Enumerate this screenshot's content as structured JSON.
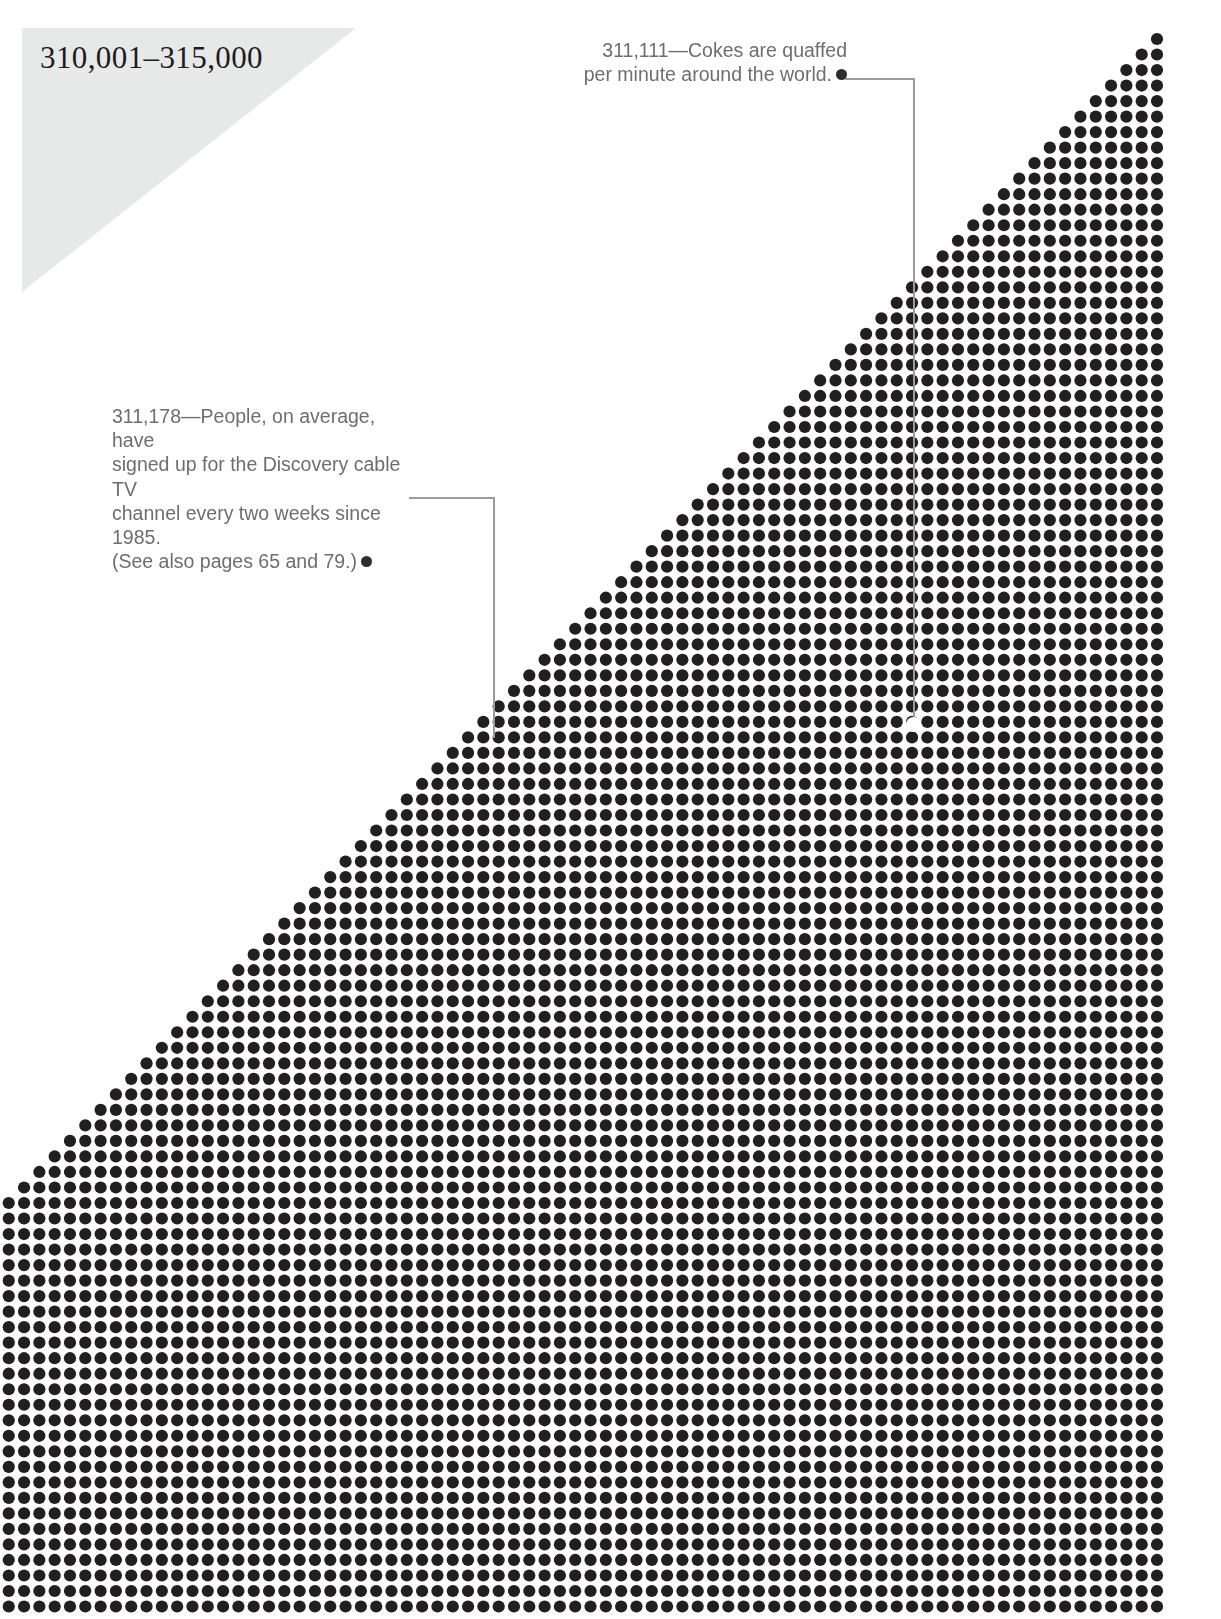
{
  "page": {
    "width": 1221,
    "height": 1619,
    "background_color": "#ffffff"
  },
  "header": {
    "range_title": "310,001–315,000",
    "triangle_color": "#e7e8e8",
    "title_color": "#1d1d1d"
  },
  "annotations": [
    {
      "id": "cokes",
      "number": "311,111",
      "text": "311,111—Cokes are quaffed\nper minute around the world.",
      "align": "right",
      "bullet_color": "#2d2d2d",
      "leader_color": "#9b9b9b",
      "text_color": "#6e6e6e"
    },
    {
      "id": "discovery",
      "number": "311,178",
      "text": "311,178—People, on average, have\nsigned up for the Discovery cable TV\nchannel every two weeks since 1985.\n(See also pages 65 and 79.)",
      "align": "left",
      "bullet_color": "#2d2d2d",
      "leader_color": "#9b9b9b",
      "text_color": "#6e6e6e"
    }
  ],
  "chart_data": {
    "type": "scatter",
    "title": "310,001–315,000",
    "xlabel": "",
    "ylabel": "",
    "grid": false,
    "legend": null,
    "dot_color": "#231f20",
    "dot_diameter": 12.2,
    "col_pitch": 15.31,
    "row_pitch": 15.52,
    "first_dot_x": 1157,
    "first_dot_y": 39,
    "rows": 102,
    "max_columns": 76,
    "annotated_points": [
      {
        "label": "311,111",
        "col_from_right": 16,
        "row": 44
      },
      {
        "label": "311,178",
        "col_from_right": 44,
        "row": 45
      }
    ]
  },
  "leaders": {
    "cokes": {
      "bullet_x": 845,
      "bullet_y": 79,
      "corner_x": 913,
      "end_y": 724
    },
    "discovery": {
      "bullet_x": 409,
      "bullet_y": 498,
      "corner_x": 493,
      "end_y": 738
    }
  }
}
